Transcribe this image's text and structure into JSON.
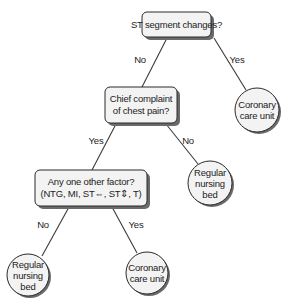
{
  "diagram": {
    "type": "decision-tree",
    "nodes": {
      "q1": {
        "kind": "decision",
        "lines": [
          "ST segment changes?"
        ]
      },
      "ccu1": {
        "kind": "outcome",
        "lines": [
          "Coronary",
          "care unit"
        ]
      },
      "q2": {
        "kind": "decision",
        "lines": [
          "Chief complaint",
          "of chest pain?"
        ]
      },
      "rnb1": {
        "kind": "outcome",
        "lines": [
          "Regular",
          "nursing",
          "bed"
        ]
      },
      "q3": {
        "kind": "decision",
        "lines": [
          "Any one other factor?",
          "(NTG, MI, ST⇔, ST⇕, T)"
        ]
      },
      "rnb2": {
        "kind": "outcome",
        "lines": [
          "Regular",
          "nursing",
          "bed"
        ]
      },
      "ccu2": {
        "kind": "outcome",
        "lines": [
          "Coronary",
          "care unit"
        ]
      }
    },
    "edges": {
      "q1_no": {
        "from": "q1",
        "to": "q2",
        "label": "No"
      },
      "q1_yes": {
        "from": "q1",
        "to": "ccu1",
        "label": "Yes"
      },
      "q2_yes": {
        "from": "q2",
        "to": "q3",
        "label": "Yes"
      },
      "q2_no": {
        "from": "q2",
        "to": "rnb1",
        "label": "No"
      },
      "q3_no": {
        "from": "q3",
        "to": "rnb2",
        "label": "No"
      },
      "q3_yes": {
        "from": "q3",
        "to": "ccu2",
        "label": "Yes"
      }
    }
  }
}
